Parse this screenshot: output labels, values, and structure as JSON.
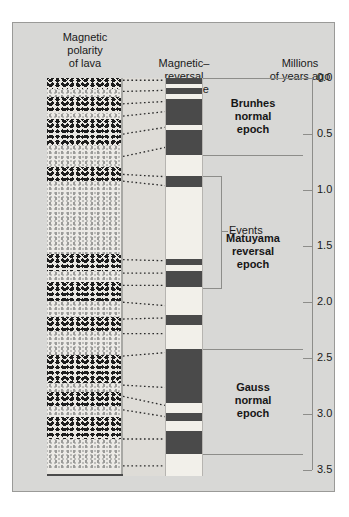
{
  "figure": {
    "headers": {
      "lava": "Magnetic\npolarity\nof lava",
      "scale": "Magnetic–\nreversal\ntime scale",
      "axis": "Millions\nof years ago"
    },
    "events_label": "Events",
    "colors": {
      "panel_background": "#d8d8d6",
      "normal_band": "#4a4a4a",
      "reversed_band": "#f2f0ea",
      "rule": "#8d8d8a"
    }
  },
  "chart_data": {
    "type": "bar",
    "xlabel": "",
    "ylabel": "Millions of years ago",
    "ylim": [
      0.0,
      3.55
    ],
    "grid": false,
    "legend": "none",
    "axis_ticks": [
      "0.0",
      "0.5",
      "1.0",
      "1.5",
      "2.0",
      "2.5",
      "3.0",
      "3.5"
    ],
    "axis_tick_values": [
      0.0,
      0.5,
      1.0,
      1.5,
      2.0,
      2.5,
      3.0,
      3.5
    ],
    "epochs": [
      {
        "name": "Brunhes\nnormal\nepoch",
        "start": 0.0,
        "end": 0.69
      },
      {
        "name": "Matuyama\nreversal\nepoch",
        "start": 0.69,
        "end": 2.42
      },
      {
        "name": "Gauss\nnormal\nepoch",
        "start": 2.42,
        "end": 3.35
      }
    ],
    "normal_polarity_bands": [
      {
        "start": 0.0,
        "end": 0.05
      },
      {
        "start": 0.09,
        "end": 0.14
      },
      {
        "start": 0.19,
        "end": 0.42
      },
      {
        "start": 0.46,
        "end": 0.69
      },
      {
        "start": 0.87,
        "end": 0.97
      },
      {
        "start": 1.61,
        "end": 1.67
      },
      {
        "start": 1.72,
        "end": 1.86
      },
      {
        "start": 2.11,
        "end": 2.2
      },
      {
        "start": 2.42,
        "end": 2.9
      },
      {
        "start": 2.99,
        "end": 3.06
      },
      {
        "start": 3.15,
        "end": 3.35
      }
    ],
    "event_bracket": {
      "start": 0.87,
      "end": 1.86,
      "label": "Events"
    },
    "lava_column": {
      "label": "Magnetic polarity of lava",
      "layers": [
        {
          "polarity": "normal",
          "start": 0.0,
          "end": 0.1
        },
        {
          "polarity": "reversed",
          "start": 0.1,
          "end": 0.17
        },
        {
          "polarity": "normal",
          "start": 0.17,
          "end": 0.31
        },
        {
          "polarity": "reversed",
          "start": 0.31,
          "end": 0.37
        },
        {
          "polarity": "normal",
          "start": 0.37,
          "end": 0.6
        },
        {
          "polarity": "reversed",
          "start": 0.6,
          "end": 0.79
        },
        {
          "polarity": "normal",
          "start": 0.79,
          "end": 0.92
        },
        {
          "polarity": "reversed",
          "start": 0.92,
          "end": 1.57
        },
        {
          "polarity": "normal",
          "start": 1.57,
          "end": 1.72
        },
        {
          "polarity": "reversed",
          "start": 1.72,
          "end": 1.82
        },
        {
          "polarity": "normal",
          "start": 1.82,
          "end": 1.99
        },
        {
          "polarity": "reversed",
          "start": 1.99,
          "end": 2.13
        },
        {
          "polarity": "normal",
          "start": 2.13,
          "end": 2.26
        },
        {
          "polarity": "reversed",
          "start": 2.26,
          "end": 2.47
        },
        {
          "polarity": "normal",
          "start": 2.47,
          "end": 2.72
        },
        {
          "polarity": "reversed",
          "start": 2.72,
          "end": 2.8
        },
        {
          "polarity": "normal",
          "start": 2.8,
          "end": 2.93
        },
        {
          "polarity": "reversed",
          "start": 2.93,
          "end": 3.02
        },
        {
          "polarity": "normal",
          "start": 3.02,
          "end": 3.22
        },
        {
          "polarity": "reversed",
          "start": 3.22,
          "end": 3.5
        }
      ]
    },
    "correlation_lines": [
      {
        "from": 0.02,
        "to": 0.02
      },
      {
        "from": 0.12,
        "to": 0.11
      },
      {
        "from": 0.23,
        "to": 0.21
      },
      {
        "from": 0.34,
        "to": 0.3
      },
      {
        "from": 0.5,
        "to": 0.44
      },
      {
        "from": 0.7,
        "to": 0.62
      },
      {
        "from": 0.86,
        "to": 0.88
      },
      {
        "from": 0.92,
        "to": 0.96
      },
      {
        "from": 1.62,
        "to": 1.63
      },
      {
        "from": 1.74,
        "to": 1.74
      },
      {
        "from": 1.85,
        "to": 1.85
      },
      {
        "from": 2.0,
        "to": 2.03
      },
      {
        "from": 2.15,
        "to": 2.14
      },
      {
        "from": 2.28,
        "to": 2.28
      },
      {
        "from": 2.48,
        "to": 2.45
      },
      {
        "from": 2.74,
        "to": 2.76
      },
      {
        "from": 2.84,
        "to": 2.92
      },
      {
        "from": 2.96,
        "to": 3.02
      },
      {
        "from": 3.22,
        "to": 3.22
      },
      {
        "from": 3.46,
        "to": 3.46
      }
    ]
  }
}
